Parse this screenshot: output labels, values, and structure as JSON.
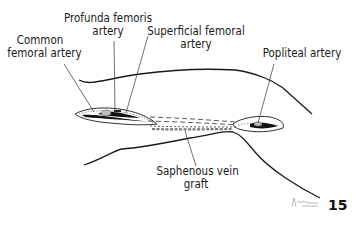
{
  "figure": {
    "number": "15",
    "labels": {
      "common_femoral": [
        "Common",
        "femoral artery"
      ],
      "profunda": [
        "Profunda femoris",
        "artery"
      ],
      "superficial_femoral": [
        "Superficial femoral",
        "artery"
      ],
      "popliteal": "Popliteal artery",
      "saphenous": [
        "Saphenous vein",
        "graft"
      ]
    },
    "colors": {
      "ink": "#1a1a1a",
      "background": "#ffffff"
    }
  }
}
